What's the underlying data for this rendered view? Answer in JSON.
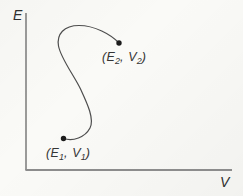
{
  "diagram": {
    "y_axis_label": "E",
    "x_axis_label": "V",
    "points": {
      "state2": {
        "open": "(",
        "var1": "E",
        "sub1": "2",
        "sep": ", ",
        "var2": "V",
        "sub2": "2",
        "close": ")"
      },
      "state1": {
        "open": "(",
        "var1": "E",
        "sub1": "1",
        "sep": ", ",
        "var2": "V",
        "sub2": "1",
        "close": ")"
      }
    },
    "colors": {
      "curve": "#4d4d4d",
      "y_axis": "#5a5a5a",
      "x_axis": "#8c8c8c",
      "dot": "#1c1c1c",
      "text": "#2e2e2e",
      "background": "#fafaf7"
    }
  }
}
